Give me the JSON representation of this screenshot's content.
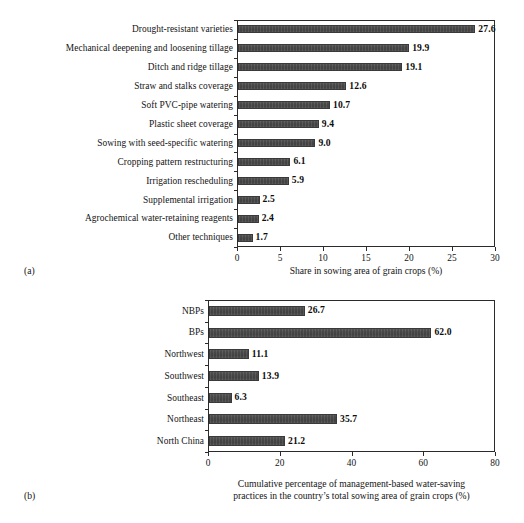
{
  "figure": {
    "panel_a_letter": "(a)",
    "panel_b_letter": "(b)",
    "bar_color": "#4d4d4d",
    "axis_color": "#2b2b2b",
    "text_color": "#141414"
  },
  "chart_data": [
    {
      "type": "bar",
      "orientation": "horizontal",
      "panel": "(a)",
      "title": "",
      "xlabel": "Share in sowing area of grain crops (%)",
      "ylabel": "",
      "xlim": [
        0,
        30
      ],
      "xticks": [
        0,
        5,
        10,
        15,
        20,
        25,
        30
      ],
      "xticklabels": [
        "0",
        "5",
        "10",
        "15",
        "20",
        "25",
        "30"
      ],
      "grid": false,
      "legend": "none",
      "categories": [
        "Drought-resistant varieties",
        "Mechanical deepening and loosening tillage",
        "Ditch and ridge tillage",
        "Straw and stalks coverage",
        "Soft PVC-pipe watering",
        "Plastic sheet coverage",
        "Sowing with seed-specific watering",
        "Cropping pattern restructuring",
        "Irrigation rescheduling",
        "Supplemental irrigation",
        "Agrochemical water-retaining reagents",
        "Other techniques"
      ],
      "values": [
        27.6,
        19.9,
        19.1,
        12.6,
        10.7,
        9.4,
        9.0,
        6.1,
        5.9,
        2.5,
        2.4,
        1.7
      ],
      "value_labels": [
        "27.6",
        "19.9",
        "19.1",
        "12.6",
        "10.7",
        "9.4",
        "9.0",
        "6.1",
        "5.9",
        "2.5",
        "2.4",
        "1.7"
      ]
    },
    {
      "type": "bar",
      "orientation": "horizontal",
      "panel": "(b)",
      "title": "",
      "xlabel": "Cumulative percentage of management-based water-saving practices in the country's total sowing area of grain crops (%)",
      "xlabel_line1": "Cumulative percentage of management-based water-saving",
      "xlabel_line2": "practices in the country’s total sowing area of grain crops (%)",
      "ylabel": "",
      "xlim": [
        0,
        80
      ],
      "xticks": [
        0,
        20,
        40,
        60,
        80
      ],
      "xticklabels": [
        "0",
        "20",
        "40",
        "60",
        "80"
      ],
      "grid": false,
      "legend": "none",
      "categories": [
        "NBPs",
        "BPs",
        "Northwest",
        "Southwest",
        "Southeast",
        "Northeast",
        "North China"
      ],
      "values": [
        26.7,
        62.0,
        11.1,
        13.9,
        6.3,
        35.7,
        21.2
      ],
      "value_labels": [
        "26.7",
        "62.0",
        "11.1",
        "13.9",
        "6.3",
        "35.7",
        "21.2"
      ]
    }
  ]
}
